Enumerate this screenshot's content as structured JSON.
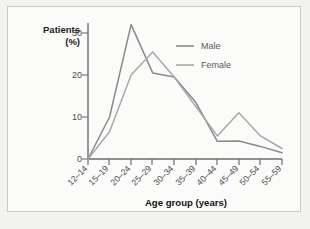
{
  "figure": {
    "caption_partial": ""
  },
  "chart_data": {
    "type": "line",
    "title": "",
    "ylabel_line1": "Patients",
    "ylabel_line2": "(%)",
    "xlabel": "Age group (years)",
    "categories": [
      "12–14",
      "15–19",
      "20–24",
      "25–29",
      "30–34",
      "35–39",
      "40–44",
      "45–49",
      "50–54",
      "55–59"
    ],
    "yticks": [
      0,
      10,
      20,
      30
    ],
    "ylim": [
      0,
      33
    ],
    "grid": false,
    "legend_position": "top-right",
    "series": [
      {
        "name": "Male",
        "color": "#8a8a8a",
        "values": [
          0,
          10,
          32,
          20.5,
          19.5,
          13.5,
          4.2,
          4.3,
          3.0,
          1.5
        ]
      },
      {
        "name": "Female",
        "color": "#a8a8a8",
        "values": [
          0,
          6.5,
          20,
          25.5,
          19.5,
          12.5,
          5.5,
          11.0,
          5.5,
          2.5
        ]
      }
    ]
  }
}
